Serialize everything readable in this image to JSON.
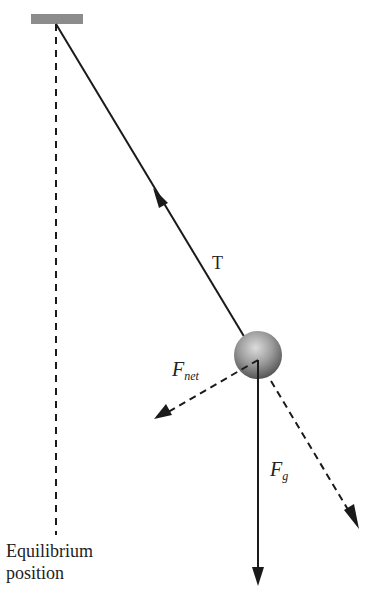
{
  "diagram": {
    "type": "pendulum-force-diagram",
    "labels": {
      "tension": "T",
      "net_force_main": "F",
      "net_force_sub": "net",
      "gravity_main": "F",
      "gravity_sub": "g",
      "equilibrium_line1": "Equilibrium",
      "equilibrium_line2": "position"
    },
    "colors": {
      "support": "#8c8c8c",
      "line": "#1a1a1a",
      "bob_light": "#d8d8d8",
      "bob_dark": "#5a5a5a"
    }
  }
}
